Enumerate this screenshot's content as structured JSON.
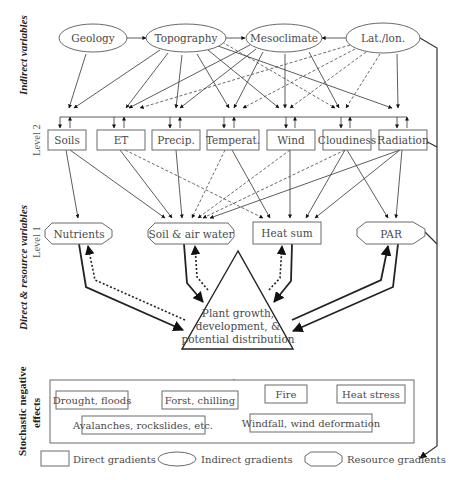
{
  "side_labels": {
    "indirect": "Indirect variables",
    "direct": "Direct & resource variables",
    "level2": "Level 2",
    "level1": "Level 1",
    "stochastic_line1": "Stochastic negative",
    "stochastic_line2": "effects"
  },
  "indirect_nodes": [
    {
      "id": "geology",
      "label": "Geology"
    },
    {
      "id": "topography",
      "label": "Topography"
    },
    {
      "id": "mesoclimate",
      "label": "Mesoclimate"
    },
    {
      "id": "latlon",
      "label": "Lat./lon."
    }
  ],
  "direct_nodes": [
    {
      "id": "soils",
      "label": "Soils"
    },
    {
      "id": "et",
      "label": "ET"
    },
    {
      "id": "precip",
      "label": "Precip."
    },
    {
      "id": "temperat",
      "label": "Temperat."
    },
    {
      "id": "wind",
      "label": "Wind"
    },
    {
      "id": "cloudiness",
      "label": "Cloudiness"
    },
    {
      "id": "radiation",
      "label": "Radiation"
    }
  ],
  "resource_nodes": [
    {
      "id": "nutrients",
      "label": "Nutrients"
    },
    {
      "id": "soil_air_water",
      "label": "Soil & air water"
    },
    {
      "id": "heat_sum",
      "label": "Heat sum"
    },
    {
      "id": "par",
      "label": "PAR"
    }
  ],
  "center": {
    "line1": "Plant growth,",
    "line2": "development, &",
    "line3": "potential distribution"
  },
  "stochastic_effects": [
    {
      "id": "drought",
      "label": "Drought, floods"
    },
    {
      "id": "frost",
      "label": "Forst, chilling"
    },
    {
      "id": "fire",
      "label": "Fire"
    },
    {
      "id": "heat_stress",
      "label": "Heat stress"
    },
    {
      "id": "avalanches",
      "label": "Avalanches, rockslides, etc."
    },
    {
      "id": "windfall",
      "label": "Windfall, wind deformation"
    }
  ],
  "legend": {
    "direct": "Direct gradients",
    "indirect": "Indirect gradients",
    "resource": "Resource gradients"
  }
}
